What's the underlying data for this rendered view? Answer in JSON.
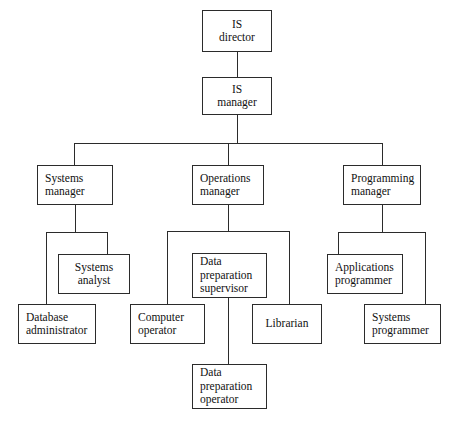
{
  "chart_data": {
    "type": "diagram",
    "diagram_kind": "organization-chart",
    "title": "",
    "nodes": [
      {
        "id": "is-director",
        "label": "IS director",
        "lines": [
          "IS",
          "director"
        ],
        "level": 0,
        "align": "center",
        "x": 202,
        "y": 10,
        "w": 70,
        "h": 42
      },
      {
        "id": "is-manager",
        "label": "IS manager",
        "lines": [
          "IS",
          "manager"
        ],
        "level": 1,
        "align": "center",
        "x": 202,
        "y": 77,
        "w": 70,
        "h": 38
      },
      {
        "id": "systems-manager",
        "label": "Systems manager",
        "lines": [
          "Systems",
          "manager"
        ],
        "level": 2,
        "align": "left",
        "x": 37,
        "y": 165,
        "w": 76,
        "h": 40
      },
      {
        "id": "operations-manager",
        "label": "Operations manager",
        "lines": [
          "Operations",
          "manager"
        ],
        "level": 2,
        "align": "left",
        "x": 192,
        "y": 165,
        "w": 72,
        "h": 40
      },
      {
        "id": "programming-manager",
        "label": "Programming manager",
        "lines": [
          "Programming",
          "manager"
        ],
        "level": 2,
        "align": "left",
        "x": 343,
        "y": 165,
        "w": 78,
        "h": 40
      },
      {
        "id": "systems-analyst",
        "label": "Systems analyst",
        "lines": [
          "Systems",
          "analyst"
        ],
        "level": 3,
        "align": "center",
        "x": 58,
        "y": 254,
        "w": 72,
        "h": 40
      },
      {
        "id": "data-preparation-supervisor",
        "label": "Data preparation supervisor",
        "lines": [
          "Data",
          "preparation",
          "supervisor"
        ],
        "level": 3,
        "align": "left",
        "x": 192,
        "y": 253,
        "w": 75,
        "h": 45
      },
      {
        "id": "applications-programmer",
        "label": "Applications programmer",
        "lines": [
          "Applications",
          "programmer"
        ],
        "level": 3,
        "align": "left",
        "x": 327,
        "y": 254,
        "w": 76,
        "h": 40
      },
      {
        "id": "database-administrator",
        "label": "Database administrator",
        "lines": [
          "Database",
          "administrator"
        ],
        "level": 4,
        "align": "left",
        "x": 18,
        "y": 304,
        "w": 78,
        "h": 40
      },
      {
        "id": "computer-operator",
        "label": "Computer operator",
        "lines": [
          "Computer",
          "operator"
        ],
        "level": 4,
        "align": "left",
        "x": 130,
        "y": 304,
        "w": 75,
        "h": 40
      },
      {
        "id": "librarian",
        "label": "Librarian",
        "lines": [
          "Librarian"
        ],
        "level": 4,
        "align": "center",
        "x": 252,
        "y": 304,
        "w": 70,
        "h": 40
      },
      {
        "id": "systems-programmer",
        "label": "Systems programmer",
        "lines": [
          "Systems",
          "programmer"
        ],
        "level": 4,
        "align": "left",
        "x": 364,
        "y": 304,
        "w": 77,
        "h": 40
      },
      {
        "id": "data-preparation-operator",
        "label": "Data preparation operator",
        "lines": [
          "Data",
          "preparation",
          "operator"
        ],
        "level": 5,
        "align": "left",
        "x": 192,
        "y": 364,
        "w": 75,
        "h": 45
      }
    ],
    "edges": [
      {
        "from": "is-director",
        "to": "is-manager"
      },
      {
        "from": "is-manager",
        "to": "systems-manager"
      },
      {
        "from": "is-manager",
        "to": "operations-manager"
      },
      {
        "from": "is-manager",
        "to": "programming-manager"
      },
      {
        "from": "systems-manager",
        "to": "systems-analyst"
      },
      {
        "from": "systems-manager",
        "to": "database-administrator"
      },
      {
        "from": "operations-manager",
        "to": "data-preparation-supervisor"
      },
      {
        "from": "operations-manager",
        "to": "computer-operator"
      },
      {
        "from": "operations-manager",
        "to": "librarian"
      },
      {
        "from": "programming-manager",
        "to": "applications-programmer"
      },
      {
        "from": "programming-manager",
        "to": "systems-programmer"
      },
      {
        "from": "data-preparation-supervisor",
        "to": "data-preparation-operator"
      }
    ],
    "connectors": [
      {
        "id": "c-director-manager",
        "orient": "v",
        "x": 237,
        "y": 52,
        "len": 25
      },
      {
        "id": "c-manager-drop",
        "orient": "v",
        "x": 237,
        "y": 115,
        "len": 28
      },
      {
        "id": "c-manager-bus",
        "orient": "h",
        "x": 74,
        "y": 143,
        "len": 308
      },
      {
        "id": "c-bus-to-systems-mgr",
        "orient": "v",
        "x": 74,
        "y": 143,
        "len": 23
      },
      {
        "id": "c-bus-to-operations-mgr",
        "orient": "v",
        "x": 228,
        "y": 143,
        "len": 23
      },
      {
        "id": "c-bus-to-programming-mgr",
        "orient": "v",
        "x": 382,
        "y": 143,
        "len": 23
      },
      {
        "id": "c-sysmgr-drop",
        "orient": "v",
        "x": 75,
        "y": 205,
        "len": 27
      },
      {
        "id": "c-sysmgr-bus",
        "orient": "h",
        "x": 46,
        "y": 232,
        "len": 61
      },
      {
        "id": "c-bus-to-sysanalyst",
        "orient": "v",
        "x": 107,
        "y": 232,
        "len": 23
      },
      {
        "id": "c-bus-to-dbadmin",
        "orient": "v",
        "x": 46,
        "y": 232,
        "len": 72
      },
      {
        "id": "c-opsmgr-drop",
        "orient": "v",
        "x": 228,
        "y": 205,
        "len": 26
      },
      {
        "id": "c-opsmgr-bus",
        "orient": "h",
        "x": 167,
        "y": 231,
        "len": 122
      },
      {
        "id": "c-bus-to-compoperator",
        "orient": "v",
        "x": 167,
        "y": 231,
        "len": 73
      },
      {
        "id": "c-bus-to-librarian",
        "orient": "v",
        "x": 289,
        "y": 231,
        "len": 73
      },
      {
        "id": "c-dataprep-to-operator",
        "orient": "v",
        "x": 228,
        "y": 298,
        "len": 66
      },
      {
        "id": "c-progmgr-drop",
        "orient": "v",
        "x": 382,
        "y": 205,
        "len": 27
      },
      {
        "id": "c-progmgr-bus",
        "orient": "h",
        "x": 338,
        "y": 232,
        "len": 87
      },
      {
        "id": "c-bus-to-appsprog",
        "orient": "v",
        "x": 338,
        "y": 232,
        "len": 23
      },
      {
        "id": "c-bus-to-sysprog",
        "orient": "v",
        "x": 425,
        "y": 232,
        "len": 72
      }
    ]
  }
}
